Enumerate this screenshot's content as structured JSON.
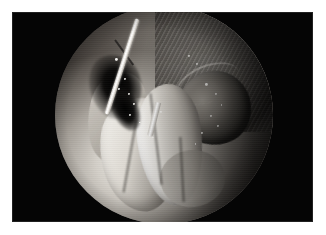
{
  "page": {
    "background_color": "#ffffff",
    "width": 326,
    "height": 235
  },
  "figure": {
    "name": "laparoscopic-surgical-photograph",
    "plate_color": "#050505",
    "modality": "endoscopic / laparoscopic still frame",
    "field_of_view_shape": "circle",
    "elements": {
      "instrument_label": "surgical instrument shaft",
      "cavity_label": "dissection cavity",
      "tissue_upper_label": "striated tissue wall",
      "organ_lobe_label": "rounded organ lobe",
      "folds_label": "pale tissue folds"
    },
    "colors": {
      "highlight": "#ffffff",
      "tissue_light": "#e9e7e2",
      "tissue_mid": "#8b8781",
      "tissue_dark": "#332f2c",
      "shadow": "#000000",
      "plate": "#050505"
    },
    "specular_highlights": [
      {
        "x": 27.5,
        "y": 24.0,
        "size": 2.6
      },
      {
        "x": 30.0,
        "y": 28.5,
        "size": 2.0
      },
      {
        "x": 31.5,
        "y": 33.0,
        "size": 2.4
      },
      {
        "x": 29.0,
        "y": 37.5,
        "size": 1.8
      },
      {
        "x": 33.5,
        "y": 40.0,
        "size": 2.2
      },
      {
        "x": 36.0,
        "y": 44.5,
        "size": 1.8
      },
      {
        "x": 34.0,
        "y": 49.5,
        "size": 2.0
      },
      {
        "x": 38.5,
        "y": 53.0,
        "size": 1.6
      },
      {
        "x": 61.0,
        "y": 22.5,
        "size": 2.4
      },
      {
        "x": 64.5,
        "y": 26.0,
        "size": 2.0
      },
      {
        "x": 69.0,
        "y": 35.5,
        "size": 2.6
      },
      {
        "x": 73.5,
        "y": 40.0,
        "size": 2.2
      },
      {
        "x": 76.0,
        "y": 45.0,
        "size": 1.8
      },
      {
        "x": 71.0,
        "y": 50.0,
        "size": 2.4
      },
      {
        "x": 74.5,
        "y": 54.5,
        "size": 1.8
      },
      {
        "x": 67.0,
        "y": 58.0,
        "size": 2.0
      },
      {
        "x": 48.0,
        "y": 48.0,
        "size": 2.2
      },
      {
        "x": 44.5,
        "y": 60.0,
        "size": 1.6
      },
      {
        "x": 64.0,
        "y": 63.0,
        "size": 1.8
      }
    ]
  },
  "caption": {
    "text": "",
    "visible": false,
    "note": "caption line is clipped by the page edge and is illegible"
  }
}
